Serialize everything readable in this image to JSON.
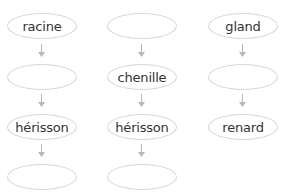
{
  "diagram": {
    "columns": [
      {
        "nodes": [
          "racine",
          "",
          "hérisson",
          ""
        ]
      },
      {
        "nodes": [
          "",
          "chenille",
          "hérisson",
          ""
        ]
      },
      {
        "nodes": [
          "gland",
          "",
          "renard"
        ]
      }
    ],
    "colors": {
      "border": "#d6d6d6",
      "arrow": "#b8b8b8",
      "text": "#333333"
    }
  }
}
